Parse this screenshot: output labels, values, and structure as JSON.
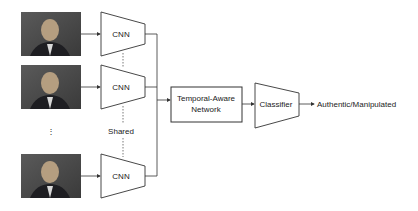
{
  "diagram": {
    "frames": [
      {
        "id": "frame-1",
        "label": "video frame 1"
      },
      {
        "id": "frame-2",
        "label": "video frame 2"
      },
      {
        "id": "frame-n",
        "label": "video frame N"
      }
    ],
    "ellipsis": "⋮",
    "cnn_label": "CNN",
    "shared_label": "Shared",
    "temporal_line1": "Temporal-Aware",
    "temporal_line2": "Network",
    "classifier_label": "Classifier",
    "output_label": "Authentic/Manipulated",
    "colors": {
      "stroke": "#333333",
      "frame_bg": "#4a4a4a",
      "frame_face": "#b8a890",
      "frame_suit": "#1e1e22"
    }
  }
}
